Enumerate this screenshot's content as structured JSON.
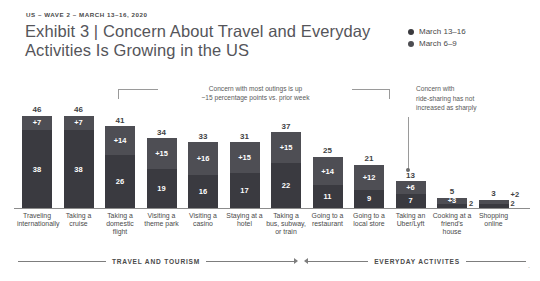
{
  "header": {
    "eyebrow": "US – WAVE 2 – MARCH 13–16, 2020",
    "title_line1": "Exhibit 3 | Concern About Travel and Everyday",
    "title_line2": "Activities Is Growing in the US"
  },
  "legend": {
    "items": [
      {
        "label": "March 13–16",
        "color": "#3a3a3e"
      },
      {
        "label": "March 6–9",
        "color": "#4d4d52"
      }
    ]
  },
  "annotations": {
    "left_line1": "Concern with most outings is up",
    "left_line2": "~15 percentage points vs. prior week",
    "right_line1": "Concern with",
    "right_line2": "ride-sharing has not",
    "right_line3": "increased as sharply"
  },
  "bands": {
    "left": "TRAVEL AND TOURISM",
    "right": "EVERYDAY ACTIVITES"
  },
  "footnote": "",
  "chart_data": {
    "type": "bar",
    "title": "Exhibit 3 | Concern About Travel and Everyday Activities Is Growing in the US",
    "subtitle": "US – WAVE 2 – MARCH 13–16, 2020",
    "stacked": true,
    "xlabel": "",
    "ylabel": "",
    "ylim": [
      0,
      50
    ],
    "grid": false,
    "legend_position": "top-right",
    "categories": [
      "Traveling internationally",
      "Taking a cruise",
      "Taking a domestic flight",
      "Visiting a theme park",
      "Visiting a casino",
      "Staying at a hotel",
      "Taking a bus, subway, or train",
      "Going to a restaurant",
      "Going to a local store",
      "Taking an Uber/Lyft",
      "Cooking at a friend's house",
      "Shopping online"
    ],
    "series": [
      {
        "name": "March 6–9",
        "values": [
          38,
          38,
          26,
          19,
          16,
          17,
          22,
          11,
          9,
          7,
          2,
          2
        ]
      },
      {
        "name": "Increase (March 13–16 vs March 6–9)",
        "values": [
          7,
          7,
          14,
          15,
          16,
          15,
          15,
          14,
          12,
          6,
          3,
          2
        ]
      }
    ],
    "totals": [
      46,
      46,
      41,
      34,
      33,
      31,
      37,
      25,
      21,
      13,
      5,
      3
    ],
    "increase_labels": [
      "+7",
      "+7",
      "+14",
      "+15",
      "+16",
      "+15",
      "+15",
      "+14",
      "+12",
      "+6",
      "+3",
      "+2"
    ],
    "base_labels": [
      "38",
      "38",
      "26",
      "19",
      "16",
      "17",
      "22",
      "11",
      "9",
      "7",
      "2",
      "2"
    ],
    "labels_outside": [
      false,
      false,
      false,
      false,
      false,
      false,
      false,
      false,
      false,
      false,
      "base",
      "both"
    ]
  }
}
